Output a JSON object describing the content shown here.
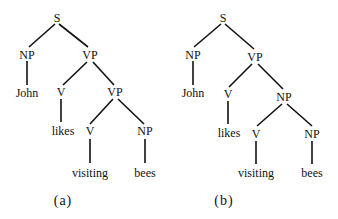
{
  "trees": [
    {
      "caption": "(a)",
      "nodes": {
        "s": "S",
        "np1": "NP",
        "vp1": "VP",
        "john": "John",
        "v1": "V",
        "vp2": "VP",
        "likes": "likes",
        "v2": "V",
        "np2": "NP",
        "visiting": "visiting",
        "bees": "bees"
      }
    },
    {
      "caption": "(b)",
      "nodes": {
        "s": "S",
        "np1": "NP",
        "vp1": "VP",
        "john": "John",
        "v1": "V",
        "np_mid": "NP",
        "likes": "likes",
        "v2": "V",
        "np2": "NP",
        "visiting": "visiting",
        "bees": "bees"
      }
    }
  ],
  "colors": {
    "line": "#111111",
    "background": "#ffffff"
  }
}
